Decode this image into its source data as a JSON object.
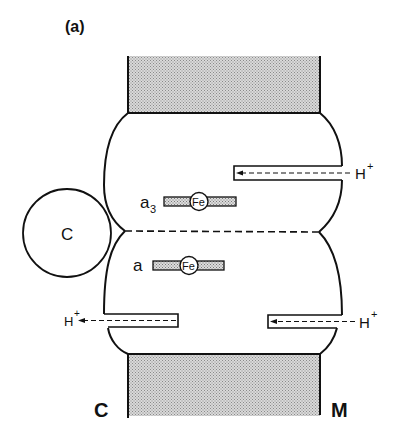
{
  "figure": {
    "panel_label": "(a)",
    "side_labels": {
      "cytoplasmic": "C",
      "matrix": "M"
    },
    "cytochrome_c_label": "C",
    "hemes": [
      {
        "label": "a",
        "subscript": "3",
        "center_label": "Fe"
      },
      {
        "label": "a",
        "subscript": "",
        "center_label": "Fe"
      }
    ],
    "proton_channels": [
      {
        "position": "upper-right",
        "label": "H",
        "superscript": "+"
      },
      {
        "position": "lower-left",
        "label": "H",
        "superscript": "+"
      },
      {
        "position": "lower-right",
        "label": "H",
        "superscript": "+"
      }
    ],
    "colors": {
      "line": "#111111",
      "membrane_fill": "#c8c8c8",
      "background": "#ffffff"
    }
  }
}
